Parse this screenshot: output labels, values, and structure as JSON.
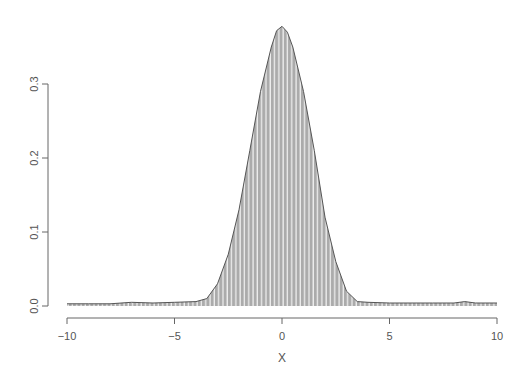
{
  "chart_data": {
    "type": "area",
    "title": "",
    "xlabel": "X",
    "ylabel": "",
    "xlim": [
      -10,
      10
    ],
    "ylim": [
      0,
      0.38
    ],
    "grid": false,
    "legend": null,
    "x_ticks": [
      -10,
      -5,
      0,
      5,
      10
    ],
    "x_tick_labels": [
      "−10",
      "−5",
      "0",
      "5",
      "10"
    ],
    "y_ticks": [
      0.0,
      0.1,
      0.2,
      0.3
    ],
    "y_tick_labels": [
      "0.0",
      "0.1",
      "0.2",
      "0.3"
    ],
    "x": [
      -10,
      -9,
      -8,
      -7,
      -6,
      -5,
      -4,
      -3.5,
      -3,
      -2.5,
      -2,
      -1.5,
      -1,
      -0.5,
      -0.25,
      0,
      0.25,
      0.5,
      1,
      1.5,
      2,
      2.5,
      3,
      3.5,
      4,
      5,
      6,
      7,
      8,
      8.5,
      9,
      10
    ],
    "values": [
      0.003,
      0.003,
      0.003,
      0.005,
      0.004,
      0.005,
      0.006,
      0.01,
      0.03,
      0.07,
      0.13,
      0.21,
      0.29,
      0.35,
      0.372,
      0.378,
      0.37,
      0.35,
      0.29,
      0.21,
      0.12,
      0.06,
      0.02,
      0.006,
      0.005,
      0.004,
      0.004,
      0.004,
      0.004,
      0.006,
      0.004,
      0.004
    ],
    "colors": {
      "fill": "#b0b0b0",
      "stripe": "#ffffff",
      "line": "#555555",
      "axis": "#666666"
    }
  }
}
